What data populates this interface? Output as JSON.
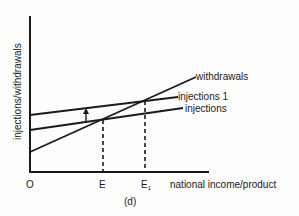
{
  "diagram": {
    "caption": "(d)",
    "y_axis_label": "injections/withdrawals",
    "x_axis_label": "national income/product",
    "origin_label": "O",
    "equilibria": [
      {
        "label": "E",
        "subscript": ""
      },
      {
        "label": "E",
        "subscript": "1"
      }
    ],
    "lines": [
      {
        "name": "withdrawals",
        "label": "withdrawals"
      },
      {
        "name": "injections-1",
        "label": "injections 1"
      },
      {
        "name": "injections",
        "label": "injections"
      }
    ],
    "shift_arrow": "upward shift from injections to injections 1"
  }
}
